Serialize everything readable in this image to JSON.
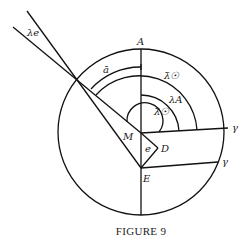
{
  "figure": {
    "caption": "FIGURE 9",
    "labels": {
      "A": "A",
      "M": "M",
      "D": "D",
      "E": "E",
      "e": "e",
      "gamma_upper": "γ",
      "gamma_lower": "γ",
      "lambda_e": "λe",
      "a_bar": "ā",
      "lambda_bar_sun_outer": "λ̄☉",
      "lambda_A": "λA",
      "lambda_bar_sun_inner": "λ̄☉"
    },
    "colors": {
      "ink": "#111111",
      "background": "#ffffff"
    }
  }
}
